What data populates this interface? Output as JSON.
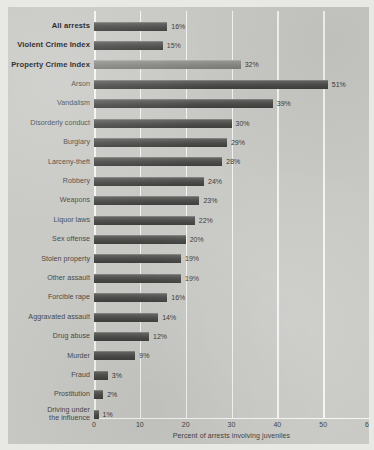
{
  "chart_data": {
    "type": "bar",
    "orientation": "horizontal",
    "title": "",
    "xlabel": "Percent of arrests involving juveniles",
    "ylabel": "",
    "xlim": [
      0,
      60
    ],
    "xticks": [
      0,
      10,
      20,
      30,
      40,
      50,
      60
    ],
    "xtick_labels": [
      "0",
      "10",
      "20",
      "30",
      "40",
      "50",
      "60"
    ],
    "grid": true,
    "legend": "none",
    "value_suffix": "%",
    "categories": [
      "All arrests",
      "Violent Crime Index",
      "Property Crime Index",
      "Arson",
      "Vandalism",
      "Disorderly conduct",
      "Burglary",
      "Larceny-theft",
      "Robbery",
      "Weapons",
      "Liquor laws",
      "Sex offense",
      "Stolen property",
      "Other assault",
      "Forcible rape",
      "Aggravated assault",
      "Drug abuse",
      "Murder",
      "Fraud",
      "Prostitution",
      "Driving under\nthe influence"
    ],
    "values": [
      16,
      15,
      32,
      51,
      39,
      30,
      29,
      28,
      24,
      23,
      22,
      20,
      19,
      19,
      16,
      14,
      12,
      9,
      3,
      2,
      1
    ],
    "value_labels": [
      "16%",
      "15%",
      "32%",
      "51%",
      "39%",
      "30%",
      "29%",
      "28%",
      "24%",
      "23%",
      "22%",
      "20%",
      "19%",
      "19%",
      "16%",
      "14%",
      "12%",
      "9%",
      "3%",
      "2%",
      "1%"
    ],
    "emphasis": [
      true,
      true,
      true,
      false,
      false,
      false,
      false,
      false,
      false,
      false,
      false,
      false,
      false,
      false,
      false,
      false,
      false,
      false,
      false,
      false,
      false
    ],
    "bar_styles": [
      "dark",
      "dark",
      "light",
      "dark",
      "dark",
      "dark",
      "dark",
      "dark",
      "dark",
      "dark",
      "dark",
      "dark",
      "dark",
      "dark",
      "dark",
      "dark",
      "dark",
      "dark",
      "dark",
      "dark",
      "dark"
    ]
  },
  "colors": {
    "page_background": "#e8e8e4",
    "panel_background": "#c9c9c6",
    "gridline": "#f4f4f2",
    "bar_dark": "#4c4c4a",
    "bar_light": "#878784",
    "label_text": "#4a4a48",
    "emphasis_text": "#16161a"
  }
}
